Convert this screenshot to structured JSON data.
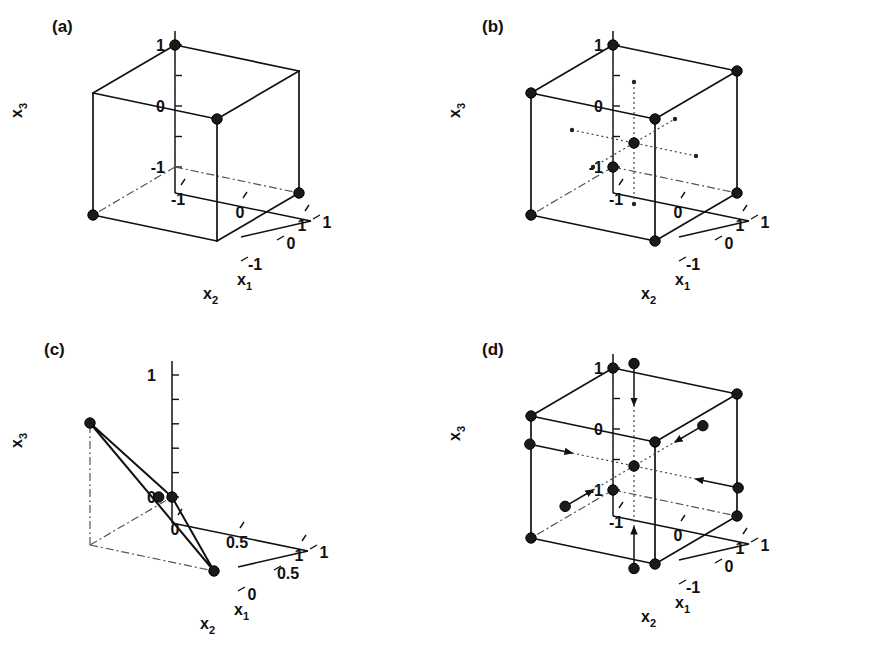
{
  "figure": {
    "background": "#ffffff",
    "point_color": "#1a1a1a",
    "line_color": "#111111"
  },
  "axis_names": {
    "x1": "x",
    "x1_sub": "1",
    "x2": "x",
    "x2_sub": "2",
    "x3": "x",
    "x3_sub": "3"
  },
  "panels": [
    {
      "id": "a",
      "tag": "(a)",
      "design": "half-fraction factorial (2^(3-1))",
      "n_points": 4,
      "axis": {
        "x1_ticks": [
          "-1",
          "0",
          "1"
        ],
        "x2_ticks": [
          "1",
          "0",
          "-1"
        ],
        "x3_ticks": [
          "1",
          "0",
          "-1"
        ],
        "range": [
          -1,
          1
        ]
      },
      "chart_data": {
        "type": "scatter3d",
        "xlabel": "x1",
        "ylabel": "x2",
        "zlabel": "x3",
        "xlim": [
          -1,
          1
        ],
        "ylim": [
          -1,
          1
        ],
        "zlim": [
          -1,
          1
        ],
        "cube": true,
        "points": [
          {
            "x": -1,
            "y": -1,
            "z": -1,
            "kind": "corner"
          },
          {
            "x": 1,
            "y": -1,
            "z": 1,
            "kind": "corner"
          },
          {
            "x": -1,
            "y": 1,
            "z": 1,
            "kind": "corner"
          },
          {
            "x": 1,
            "y": 1,
            "z": -1,
            "kind": "corner"
          }
        ]
      }
    },
    {
      "id": "b",
      "tag": "(b)",
      "design": "full factorial (2^3) with centre point",
      "n_points": 9,
      "axis": {
        "x1_ticks": [
          "-1",
          "0",
          "1"
        ],
        "x2_ticks": [
          "1",
          "0",
          "-1"
        ],
        "x3_ticks": [
          "1",
          "0",
          "-1"
        ],
        "range": [
          -1,
          1
        ]
      },
      "chart_data": {
        "type": "scatter3d",
        "xlabel": "x1",
        "ylabel": "x2",
        "zlabel": "x3",
        "xlim": [
          -1,
          1
        ],
        "ylim": [
          -1,
          1
        ],
        "zlim": [
          -1,
          1
        ],
        "cube": true,
        "centre_axes": true,
        "points": [
          {
            "x": -1,
            "y": -1,
            "z": -1,
            "kind": "corner"
          },
          {
            "x": 1,
            "y": -1,
            "z": -1,
            "kind": "corner"
          },
          {
            "x": -1,
            "y": 1,
            "z": -1,
            "kind": "corner"
          },
          {
            "x": 1,
            "y": 1,
            "z": -1,
            "kind": "corner"
          },
          {
            "x": -1,
            "y": -1,
            "z": 1,
            "kind": "corner"
          },
          {
            "x": 1,
            "y": -1,
            "z": 1,
            "kind": "corner"
          },
          {
            "x": -1,
            "y": 1,
            "z": 1,
            "kind": "corner"
          },
          {
            "x": 1,
            "y": 1,
            "z": 1,
            "kind": "corner"
          },
          {
            "x": 0,
            "y": 0,
            "z": 0,
            "kind": "centre"
          }
        ]
      }
    },
    {
      "id": "c",
      "tag": "(c)",
      "design": "simplex / mixture design with centroid",
      "n_points": 4,
      "axis": {
        "x1_ticks": [
          "0",
          "0.5",
          "1"
        ],
        "x2_ticks": [
          "1",
          "0.5",
          "0"
        ],
        "x3_ticks": [
          "0",
          "1"
        ],
        "range": [
          0,
          1
        ]
      },
      "chart_data": {
        "type": "scatter3d",
        "xlabel": "x1",
        "ylabel": "x2",
        "zlabel": "x3",
        "xlim": [
          0,
          1
        ],
        "ylim": [
          0,
          1
        ],
        "zlim": [
          0,
          1
        ],
        "cube": false,
        "simplex": true,
        "points": [
          {
            "x": 1,
            "y": 0,
            "z": 0,
            "kind": "vertex"
          },
          {
            "x": 0,
            "y": 1,
            "z": 0,
            "kind": "vertex"
          },
          {
            "x": 0,
            "y": 0,
            "z": 1,
            "kind": "vertex"
          },
          {
            "x": 0.3333,
            "y": 0.3333,
            "z": 0.3333,
            "kind": "centroid"
          }
        ]
      }
    },
    {
      "id": "d",
      "tag": "(d)",
      "design": "central composite design (face/star points)",
      "n_points": 15,
      "axis": {
        "x1_ticks": [
          "-1",
          "0",
          "1"
        ],
        "x2_ticks": [
          "1",
          "0",
          "-1"
        ],
        "x3_ticks": [
          "1",
          "0",
          "-1"
        ],
        "range": [
          -1,
          1
        ]
      },
      "chart_data": {
        "type": "scatter3d",
        "xlabel": "x1",
        "ylabel": "x2",
        "zlabel": "x3",
        "xlim": [
          -1.7,
          1.7
        ],
        "ylim": [
          -1.7,
          1.7
        ],
        "zlim": [
          -1.7,
          1.7
        ],
        "cube": true,
        "centre_axes": true,
        "alpha": 1.68,
        "points": [
          {
            "x": -1,
            "y": -1,
            "z": -1,
            "kind": "corner"
          },
          {
            "x": 1,
            "y": -1,
            "z": -1,
            "kind": "corner"
          },
          {
            "x": -1,
            "y": 1,
            "z": -1,
            "kind": "corner"
          },
          {
            "x": 1,
            "y": 1,
            "z": -1,
            "kind": "corner"
          },
          {
            "x": -1,
            "y": -1,
            "z": 1,
            "kind": "corner"
          },
          {
            "x": 1,
            "y": -1,
            "z": 1,
            "kind": "corner"
          },
          {
            "x": -1,
            "y": 1,
            "z": 1,
            "kind": "corner"
          },
          {
            "x": 1,
            "y": 1,
            "z": 1,
            "kind": "corner"
          },
          {
            "x": 0,
            "y": 0,
            "z": 0,
            "kind": "centre"
          },
          {
            "x": -1.68,
            "y": 0,
            "z": 0,
            "kind": "star"
          },
          {
            "x": 1.68,
            "y": 0,
            "z": 0,
            "kind": "star"
          },
          {
            "x": 0,
            "y": -1.68,
            "z": 0,
            "kind": "star"
          },
          {
            "x": 0,
            "y": 1.68,
            "z": 0,
            "kind": "star"
          },
          {
            "x": 0,
            "y": 0,
            "z": -1.68,
            "kind": "star"
          },
          {
            "x": 0,
            "y": 0,
            "z": 1.68,
            "kind": "star"
          }
        ]
      }
    }
  ]
}
